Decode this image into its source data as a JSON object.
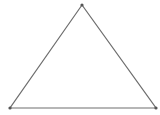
{
  "diagram": {
    "type": "triangle",
    "stroke_color": "#6e6e6e",
    "vertex_color": "#555555",
    "vertices": [
      {
        "name": "top",
        "x": 82,
        "y": 5
      },
      {
        "name": "bottom-left",
        "x": 10,
        "y": 108
      },
      {
        "name": "bottom-right",
        "x": 156,
        "y": 108
      }
    ]
  }
}
